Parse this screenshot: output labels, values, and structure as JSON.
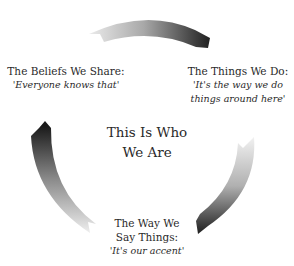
{
  "center": {
    "line1": "This Is Who",
    "line2": "We Are"
  },
  "nodes": [
    {
      "id": "beliefs",
      "title": "The Beliefs We Share:",
      "quote_lines": [
        "'Everyone knows that'"
      ]
    },
    {
      "id": "things",
      "title": "The Things We Do:",
      "quote_lines": [
        "'It's the way we do",
        "things around here'"
      ]
    },
    {
      "id": "way",
      "title_lines": [
        "The Way We",
        "Say Things:"
      ],
      "quote_lines": [
        "'It's our accent'"
      ]
    }
  ],
  "arrows": [
    {
      "from": "beliefs",
      "to": "things",
      "gradient": [
        "#e6e6e6",
        "#1e1e1e"
      ]
    },
    {
      "from": "things",
      "to": "way",
      "gradient": [
        "#e6e6e6",
        "#1e1e1e"
      ]
    },
    {
      "from": "way",
      "to": "beliefs",
      "gradient": [
        "#e6e6e6",
        "#1e1e1e"
      ]
    }
  ]
}
